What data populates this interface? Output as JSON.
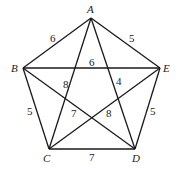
{
  "diagram": {
    "type": "complete-graph-K5",
    "vertices": [
      {
        "id": "A",
        "label": "A",
        "x": 91,
        "y": 18,
        "lx": 87,
        "ly": 13
      },
      {
        "id": "B",
        "label": "B",
        "x": 23,
        "y": 68,
        "lx": 11,
        "ly": 72
      },
      {
        "id": "C",
        "label": "C",
        "x": 49,
        "y": 149,
        "lx": 43,
        "ly": 162
      },
      {
        "id": "D",
        "label": "D",
        "x": 135,
        "y": 149,
        "lx": 132,
        "ly": 162
      },
      {
        "id": "E",
        "label": "E",
        "x": 160,
        "y": 68,
        "lx": 163,
        "ly": 72
      }
    ],
    "edges": [
      {
        "from": "A",
        "to": "B",
        "weight": "6",
        "wx": 50,
        "wy": 42
      },
      {
        "from": "A",
        "to": "E",
        "weight": "5",
        "wx": 129,
        "wy": 42
      },
      {
        "from": "B",
        "to": "E",
        "weight": "6",
        "wx": 89,
        "wy": 66
      },
      {
        "from": "A",
        "to": "C",
        "weight": "8",
        "wx": 63,
        "wy": 88
      },
      {
        "from": "A",
        "to": "D",
        "weight": "4",
        "wx": 116,
        "wy": 85
      },
      {
        "from": "B",
        "to": "D",
        "weight": "7",
        "wx": 71,
        "wy": 117
      },
      {
        "from": "C",
        "to": "E",
        "weight": "8",
        "wx": 106,
        "wy": 117
      },
      {
        "from": "B",
        "to": "C",
        "weight": "5",
        "wx": 27,
        "wy": 115
      },
      {
        "from": "E",
        "to": "D",
        "weight": "5",
        "wx": 150,
        "wy": 115
      },
      {
        "from": "C",
        "to": "D",
        "weight": "7",
        "wx": 89,
        "wy": 161
      }
    ]
  }
}
